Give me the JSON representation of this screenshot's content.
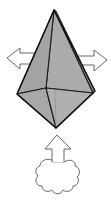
{
  "diagram": {
    "type": "origami-step",
    "colors": {
      "paper_fill": "#a9a9a9",
      "paper_fill_dark": "#9a9a9a",
      "outline": "#1a1a1a",
      "arrow_stroke": "#444444",
      "arrow_fill": "#ffffff"
    },
    "symbols": [
      {
        "name": "pull-left-arrow",
        "meaning": "pull apart"
      },
      {
        "name": "pull-right-arrow",
        "meaning": "pull apart"
      },
      {
        "name": "inflate-arrow",
        "meaning": "blow/inflate from bottom"
      }
    ]
  }
}
